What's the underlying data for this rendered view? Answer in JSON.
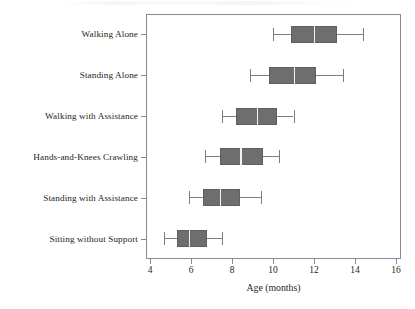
{
  "chart_data": {
    "type": "box",
    "title": "",
    "subtitle": "",
    "xlabel": "Age (months)",
    "ylabel": "",
    "xlim": [
      3.5,
      16.4
    ],
    "ylim": [
      0,
      6
    ],
    "grid": false,
    "legend": "none",
    "orientation": "horizontal",
    "xticks": [
      4,
      6,
      8,
      10,
      12,
      14,
      16
    ],
    "xtick_labels": [
      "4",
      "6",
      "8",
      "10",
      "12",
      "14",
      "16"
    ],
    "categories": [
      "Walking Alone",
      "Standing Alone",
      "Walking with Assistance",
      "Hands-and-Knees Crawling",
      "Standing with Assistance",
      "Sitting without Support"
    ],
    "boxes": [
      {
        "category": "Walking Alone",
        "whisker_low": 10.0,
        "q1": 10.9,
        "median": 12.0,
        "q3": 13.1,
        "whisker_high": 14.4
      },
      {
        "category": "Standing Alone",
        "whisker_low": 8.9,
        "q1": 9.8,
        "median": 11.0,
        "q3": 12.1,
        "whisker_high": 13.4
      },
      {
        "category": "Walking with Assistance",
        "whisker_low": 7.5,
        "q1": 8.2,
        "median": 9.2,
        "q3": 10.2,
        "whisker_high": 11.0
      },
      {
        "category": "Hands-and-Knees Crawling",
        "whisker_low": 6.7,
        "q1": 7.4,
        "median": 8.4,
        "q3": 9.5,
        "whisker_high": 10.3
      },
      {
        "category": "Standing with Assistance",
        "whisker_low": 5.9,
        "q1": 6.6,
        "median": 7.4,
        "q3": 8.4,
        "whisker_high": 9.4
      },
      {
        "category": "Sitting without Support",
        "whisker_low": 4.7,
        "q1": 5.3,
        "median": 5.9,
        "q3": 6.8,
        "whisker_high": 7.5
      }
    ],
    "colors": {
      "box_fill": "#6e6e6e",
      "box_edge": "#5f5f5f",
      "median": "#f2f2f2",
      "whisker": "#7d7d7d",
      "axis": "#8a8a8a",
      "text": "#231f20",
      "background": "#ffffff"
    }
  }
}
